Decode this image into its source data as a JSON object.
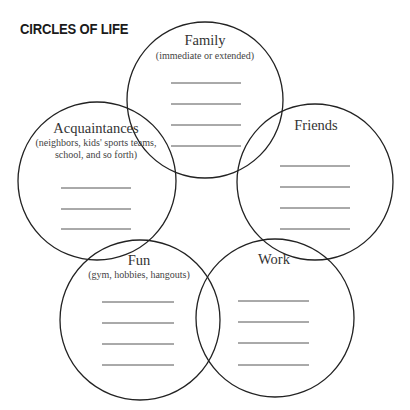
{
  "title": "CIRCLES OF LIFE",
  "colors": {
    "stroke": "#222222",
    "text": "#333333",
    "background": "#ffffff"
  },
  "circles": [
    {
      "name": "Family",
      "label": "Family",
      "subtitle": [
        "(immediate or extended)"
      ],
      "cx": 205,
      "cy": 100,
      "r": 78,
      "blank_lines": 4
    },
    {
      "name": "Friends",
      "label": "Friends",
      "subtitle": [],
      "cx": 315,
      "cy": 182,
      "r": 78,
      "blank_lines": 4
    },
    {
      "name": "Acquaintances",
      "label": "Acquaintances",
      "subtitle": [
        "(neighbors, kids' sports teams,",
        "school, and so forth)"
      ],
      "cx": 97,
      "cy": 181,
      "r": 79,
      "blank_lines": 3
    },
    {
      "name": "Fun",
      "label": "Fun",
      "subtitle": [
        "(gym, hobbies, hangouts)"
      ],
      "cx": 140,
      "cy": 320,
      "r": 80,
      "blank_lines": 4
    },
    {
      "name": "Work",
      "label": "Work",
      "subtitle": [],
      "cx": 275,
      "cy": 318,
      "r": 79,
      "blank_lines": 4
    }
  ]
}
